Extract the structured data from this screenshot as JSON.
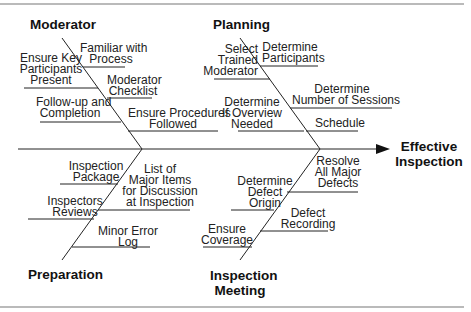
{
  "diagram": {
    "type": "fishbone",
    "effect": "Effective\nInspection",
    "categories": {
      "moderator": {
        "label": "Moderator",
        "causes": [
          "Ensure Key\nParticipants\nPresent",
          "Familiar with\nProcess",
          "Moderator\nChecklist",
          "Follow-up and\nCompletion",
          "Ensure Procedures\nFollowed"
        ]
      },
      "planning": {
        "label": "Planning",
        "causes": [
          "Select\nTrained\nModerator",
          "Determine\nParticipants",
          "Determine\nNumber of Sessions",
          "Determine\nIf Overview\nNeeded",
          "Schedule"
        ]
      },
      "preparation": {
        "label": "Preparation",
        "causes": [
          "Inspection\nPackage",
          "Inspectors\nReviews",
          "List of\nMajor Items\nfor Discussion\nat Inspection",
          "Minor Error\nLog"
        ]
      },
      "inspection_meeting": {
        "label": "Inspection\nMeeting",
        "causes": [
          "Resolve\nAll Major\nDefects",
          "Determine\nDefect\nOrigin",
          "Defect\nRecording",
          "Ensure\nCoverage"
        ]
      }
    }
  }
}
